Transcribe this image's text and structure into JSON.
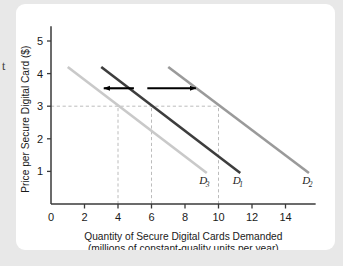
{
  "margin_fragment": "t",
  "chart_data": {
    "type": "line",
    "title": "",
    "xlabel_line1": "Quantity of Secure Digital Cards Demanded",
    "xlabel_line2": "(millions of constant-quality units per year)",
    "ylabel": "Price per Secure Digital Card ($)",
    "xlim": [
      0,
      15.8
    ],
    "ylim": [
      0,
      5.5
    ],
    "xticks": [
      0,
      2,
      4,
      6,
      8,
      10,
      12,
      14
    ],
    "xtick_labels": [
      "0",
      "2",
      "4",
      "6",
      "8",
      "10",
      "12",
      "14"
    ],
    "yticks": [
      1,
      2,
      3,
      4,
      5
    ],
    "ytick_labels": [
      "1",
      "2",
      "3",
      "4",
      "5"
    ],
    "grid": false,
    "legend_position": "inline-end-of-curve",
    "series": [
      {
        "name": "D3",
        "label": "D",
        "subscript": "3",
        "color": "#c9c9c9",
        "x": [
          1.0,
          9.3
        ],
        "y": [
          4.2,
          0.95
        ],
        "label_x": 8.85,
        "label_y": 0.62
      },
      {
        "name": "D1",
        "label": "D",
        "subscript": "1",
        "color": "#3d3d3d",
        "x": [
          3.0,
          11.3
        ],
        "y": [
          4.2,
          0.95
        ],
        "label_x": 10.85,
        "label_y": 0.62
      },
      {
        "name": "D2",
        "label": "D",
        "subscript": "2",
        "color": "#9a9a9a",
        "x": [
          7.0,
          15.4
        ],
        "y": [
          4.2,
          0.95
        ],
        "label_x": 15.0,
        "label_y": 0.62
      }
    ],
    "reference_lines": [
      {
        "name": "price-3-horizontal",
        "orientation": "horizontal",
        "value": 3,
        "from": 0,
        "to": 10,
        "style": "dashed",
        "color": "#b4b4b4"
      },
      {
        "name": "quantity-4-vertical",
        "orientation": "vertical",
        "value": 4,
        "from": 0,
        "to": 3,
        "style": "dashed",
        "color": "#b4b4b4"
      },
      {
        "name": "quantity-6-vertical",
        "orientation": "vertical",
        "value": 6,
        "from": 0,
        "to": 3,
        "style": "dashed",
        "color": "#b4b4b4"
      },
      {
        "name": "quantity-10-vertical",
        "orientation": "vertical",
        "value": 10,
        "from": 0,
        "to": 3,
        "style": "dashed",
        "color": "#b4b4b4"
      }
    ],
    "annotations": [
      {
        "name": "decrease-arrow",
        "type": "arrow",
        "direction": "left",
        "x_from": 4.95,
        "x_to": 3.15,
        "y": 3.55,
        "color": "#000000"
      },
      {
        "name": "increase-arrow",
        "type": "arrow",
        "direction": "right",
        "x_from": 5.75,
        "x_to": 8.65,
        "y": 3.55,
        "color": "#000000"
      }
    ]
  }
}
